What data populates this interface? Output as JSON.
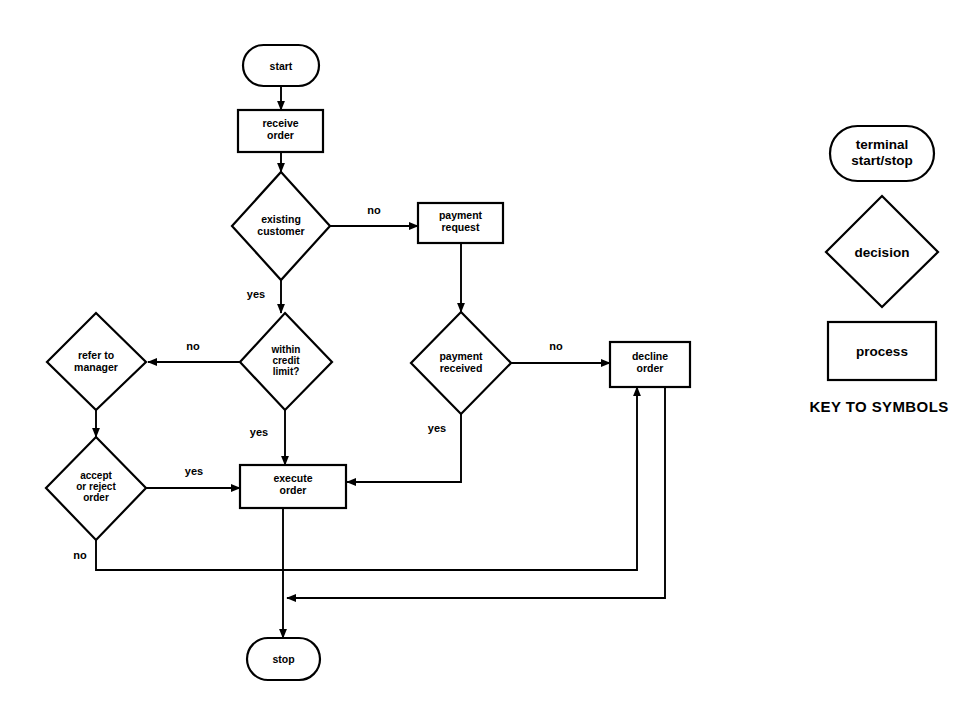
{
  "diagram": {
    "title_text": "KEY TO SYMBOLS",
    "nodes": {
      "start": {
        "label": "start",
        "type": "terminal"
      },
      "receive_order": {
        "label_line1": "receive",
        "label_line2": "order",
        "type": "process"
      },
      "existing_customer": {
        "label_line1": "existing",
        "label_line2": "customer",
        "type": "decision"
      },
      "payment_request": {
        "label_line1": "payment",
        "label_line2": "request",
        "type": "process"
      },
      "payment_received": {
        "label_line1": "payment",
        "label_line2": "received",
        "type": "decision"
      },
      "decline_order": {
        "label_line1": "decline",
        "label_line2": "order",
        "type": "process"
      },
      "within_credit_limit": {
        "label_line1": "within",
        "label_line2": "credit",
        "label_line3": "limit?",
        "type": "decision"
      },
      "refer_to_manager": {
        "label_line1": "refer to",
        "label_line2": "manager",
        "type": "decision"
      },
      "accept_or_reject": {
        "label_line1": "accept",
        "label_line2": "or reject",
        "label_line3": "order",
        "type": "decision"
      },
      "execute_order": {
        "label_line1": "execute",
        "label_line2": "order",
        "type": "process"
      },
      "stop": {
        "label": "stop",
        "type": "terminal"
      }
    },
    "edge_labels": {
      "existing_customer_no": "no",
      "existing_customer_yes": "yes",
      "payment_received_no": "no",
      "payment_received_yes": "yes",
      "within_credit_limit_no": "no",
      "within_credit_limit_yes": "yes",
      "accept_or_reject_yes": "yes",
      "accept_or_reject_no": "no"
    },
    "legend": {
      "terminal": {
        "label_line1": "terminal",
        "label_line2": "start/stop"
      },
      "decision": {
        "label": "decision"
      },
      "process": {
        "label": "process"
      },
      "heading": "KEY TO SYMBOLS"
    },
    "colors": {
      "stroke": "#000000",
      "fill": "#ffffff",
      "background": "#ffffff"
    }
  }
}
